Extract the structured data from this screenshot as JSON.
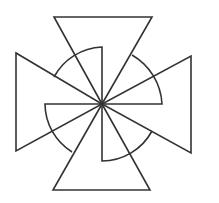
{
  "figure": {
    "stroke_color": "#333333",
    "background": "#ffffff",
    "center": [
      102,
      104
    ],
    "triangles": [
      {
        "name": "top",
        "points": [
          [
            54,
            17
          ],
          [
            152,
            17
          ],
          [
            102,
            104
          ]
        ]
      },
      {
        "name": "right",
        "points": [
          [
            191,
            56
          ],
          [
            191,
            153
          ],
          [
            102,
            104
          ]
        ]
      },
      {
        "name": "bottom",
        "points": [
          [
            53,
            190
          ],
          [
            150,
            190
          ],
          [
            102,
            104
          ]
        ]
      },
      {
        "name": "left",
        "points": [
          [
            16,
            53
          ],
          [
            16,
            151
          ],
          [
            102,
            104
          ]
        ]
      }
    ],
    "sectors": [
      {
        "name": "top-left",
        "path": "M102,104 L102,47 A57,57 0 0 0 54,77"
      },
      {
        "name": "top-right",
        "path": "M102,104 L162,104 A60,60 0 0 0 132,55"
      },
      {
        "name": "bottom-right",
        "path": "M102,104 L102,161 A57,57 0 0 0 152,131"
      },
      {
        "name": "bottom-left",
        "path": "M102,104 L45,104 A57,57 0 0 0 72,152"
      }
    ]
  }
}
